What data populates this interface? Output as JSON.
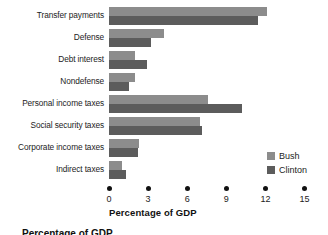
{
  "chart_data": {
    "type": "bar",
    "orientation": "horizontal",
    "title": "",
    "xlabel": "Percentage of GDP",
    "ylabel": "",
    "xlim": [
      0,
      15
    ],
    "xticks": [
      0,
      3,
      6,
      9,
      12,
      15
    ],
    "grid": false,
    "legend_position": "right-bottom",
    "categories": [
      "Transfer payments",
      "Defense",
      "Debt interest",
      "Nondefense",
      "Personal income taxes",
      "Social security taxes",
      "Corporate income taxes",
      "Indirect taxes"
    ],
    "series": [
      {
        "name": "Bush",
        "color": "#8c8c8c",
        "values": [
          12.1,
          4.2,
          2.0,
          2.0,
          7.6,
          7.0,
          2.3,
          1.0
        ]
      },
      {
        "name": "Clinton",
        "color": "#5c5c5c",
        "values": [
          11.4,
          3.2,
          2.9,
          1.5,
          10.2,
          7.1,
          2.2,
          1.3
        ]
      }
    ]
  },
  "axis": {
    "title": "Percentage of GDP",
    "tick_labels": [
      "0",
      "3",
      "6",
      "9",
      "12",
      "15"
    ]
  },
  "legend": {
    "entries": [
      {
        "label": "Bush",
        "color": "#8c8c8c"
      },
      {
        "label": "Clinton",
        "color": "#5c5c5c"
      }
    ]
  },
  "caption": {
    "sliver_text": "Percentage of GDP"
  }
}
